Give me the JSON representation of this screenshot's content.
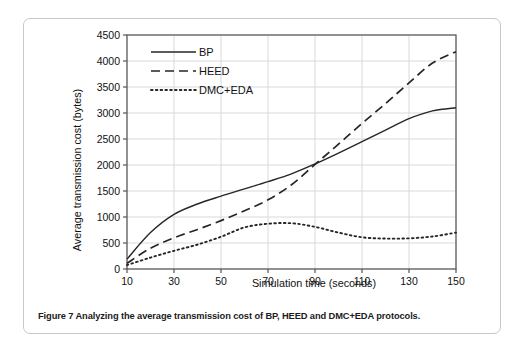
{
  "caption": {
    "prefix": "Figure 7",
    "text": "Figure 7 Analyzing the average transmission cost of BP, HEED and DMC+EDA protocols."
  },
  "chart_data": {
    "type": "line",
    "title": "",
    "xlabel": "Simulation time (seconds)",
    "ylabel": "Average transmission cost (bytes)",
    "xlim": [
      10,
      150
    ],
    "ylim": [
      0,
      4500
    ],
    "xticks": [
      10,
      30,
      50,
      70,
      90,
      110,
      130,
      150
    ],
    "yticks": [
      0,
      500,
      1000,
      1500,
      2000,
      2500,
      3000,
      3500,
      4000,
      4500
    ],
    "grid": true,
    "legend_position": "top-left",
    "x": [
      10,
      20,
      30,
      40,
      50,
      60,
      70,
      80,
      90,
      100,
      110,
      120,
      130,
      140,
      150
    ],
    "series": [
      {
        "name": "BP",
        "style": "solid",
        "color": "#262626",
        "values": [
          190,
          700,
          1050,
          1250,
          1400,
          1540,
          1680,
          1830,
          2020,
          2230,
          2450,
          2670,
          2890,
          3040,
          3100
        ]
      },
      {
        "name": "HEED",
        "style": "dashed",
        "color": "#262626",
        "values": [
          110,
          400,
          600,
          760,
          930,
          1120,
          1330,
          1620,
          2010,
          2400,
          2800,
          3180,
          3580,
          3960,
          4180
        ]
      },
      {
        "name": "DMC+EDA",
        "style": "dotted",
        "color": "#262626",
        "values": [
          75,
          220,
          350,
          470,
          620,
          800,
          870,
          880,
          810,
          700,
          610,
          585,
          590,
          625,
          700
        ]
      }
    ]
  },
  "axis": {
    "x_tick_labels": [
      "10",
      "30",
      "50",
      "70",
      "90",
      "110",
      "130",
      "150"
    ],
    "y_tick_labels": [
      "0",
      "500",
      "1000",
      "1500",
      "2000",
      "2500",
      "3000",
      "3500",
      "4000",
      "4500"
    ]
  },
  "legend": {
    "items": [
      {
        "label": "BP",
        "style": "solid"
      },
      {
        "label": "HEED",
        "style": "dashed"
      },
      {
        "label": "DMC+EDA",
        "style": "dotted"
      }
    ]
  },
  "colors": {
    "card_border": "#c8c8c8",
    "plot_frame": "#555555",
    "gridline": "#d9d9d9",
    "series": "#262626",
    "text": "#111111"
  }
}
